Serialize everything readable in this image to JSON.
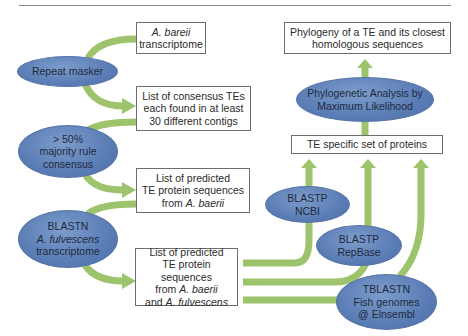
{
  "colors": {
    "arrow_green": "#9dc46c",
    "ellipse_blue": "#5a7db5",
    "box_border": "#6e6e6e",
    "rule": "#8a8a8a"
  },
  "left_column": {
    "box_a_bareii": {
      "line1": "A. bareii",
      "line2": "transcriptome"
    },
    "ellipse_repeat_masker": {
      "label": "Repeat masker"
    },
    "box_consensus": {
      "line1": "List of consensus TEs",
      "line2": "each found in at least",
      "line3": "30 different contigs"
    },
    "ellipse_majority": {
      "line1": "> 50%",
      "line2": "majority rule",
      "line3": "consensus"
    },
    "box_predicted_baerii": {
      "line1": "List of predicted",
      "line2": "TE protein sequences",
      "line3_prefix": "from ",
      "line3_italic": "A. baerii"
    },
    "ellipse_blastn": {
      "line1": "BLASTN",
      "line2": "A. fulvescens",
      "line3": "transcriptome"
    },
    "box_predicted_both": {
      "line1": "List of predicted",
      "line2": "TE protein sequences",
      "line3_prefix": "from ",
      "line3_italic": "A. baerii",
      "line4_prefix": "and ",
      "line4_italic": "A. fulvescens"
    }
  },
  "right_column": {
    "box_phylogeny": {
      "line1": "Phylogeny of a TE and its closest",
      "line2": "homologous sequences"
    },
    "ellipse_ml": {
      "line1": "Phylogenetic Analysis by",
      "line2": "Maximum Likelihood"
    },
    "box_te_specific": {
      "label": "TE specific set of proteins"
    },
    "ellipse_blastp_ncbi": {
      "line1": "BLASTP",
      "line2": "NCBI"
    },
    "ellipse_blastp_repbase": {
      "line1": "BLASTP",
      "line2": "RepBase"
    },
    "ellipse_tblastn": {
      "line1": "TBLASTN",
      "line2": "Fish genomes",
      "line3": "@ Elnsembl"
    }
  }
}
